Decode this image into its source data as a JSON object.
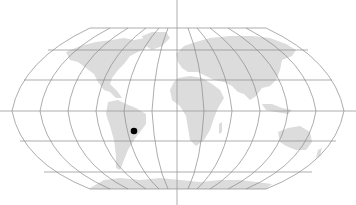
{
  "map": {
    "projection": "robinson",
    "background_color": "#ffffff",
    "land_color": "#dcdcdc",
    "graticule_color": "#8a8a8a",
    "locator_line_color": "#9a9a9a",
    "marker": {
      "label": "",
      "x": 134,
      "y": 131,
      "radius": 3.3,
      "color": "#000000",
      "region": "south-america-central-brazil"
    },
    "crosshair": {
      "x": 177,
      "y": 111
    }
  }
}
